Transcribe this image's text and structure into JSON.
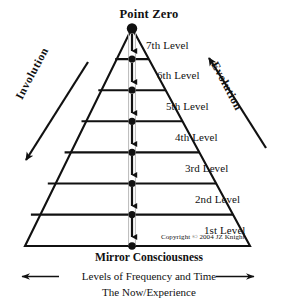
{
  "diagram": {
    "title": "Point Zero",
    "apex_label": "Point Zero",
    "base_label": "Mirror Consciousness",
    "axis_label": "Levels of Frequency and Time",
    "sub_axis_label": "The Now/Experience",
    "copyright": "Copyright © 2004 JZ Knight",
    "left_arrow_label": "Involution",
    "right_arrow_label": "Evolution",
    "levels": [
      {
        "label": "7th Level"
      },
      {
        "label": "6th Level"
      },
      {
        "label": "5th Level"
      },
      {
        "label": "4th Level"
      },
      {
        "label": "3rd Level"
      },
      {
        "label": "2nd Level"
      },
      {
        "label": "1st Level"
      }
    ],
    "colors": {
      "ink": "#111111",
      "background": "#ffffff",
      "line": "#111111"
    },
    "icons": {
      "apex_node": "filled-circle-node",
      "level_node": "filled-circle-node",
      "down_arrow": "down-arrow-icon",
      "involution_arrow": "down-left-arrow-icon",
      "evolution_arrow": "up-right-arrow-icon",
      "axis_left_arrow": "left-arrow-icon",
      "axis_right_arrow": "right-arrow-icon"
    }
  }
}
